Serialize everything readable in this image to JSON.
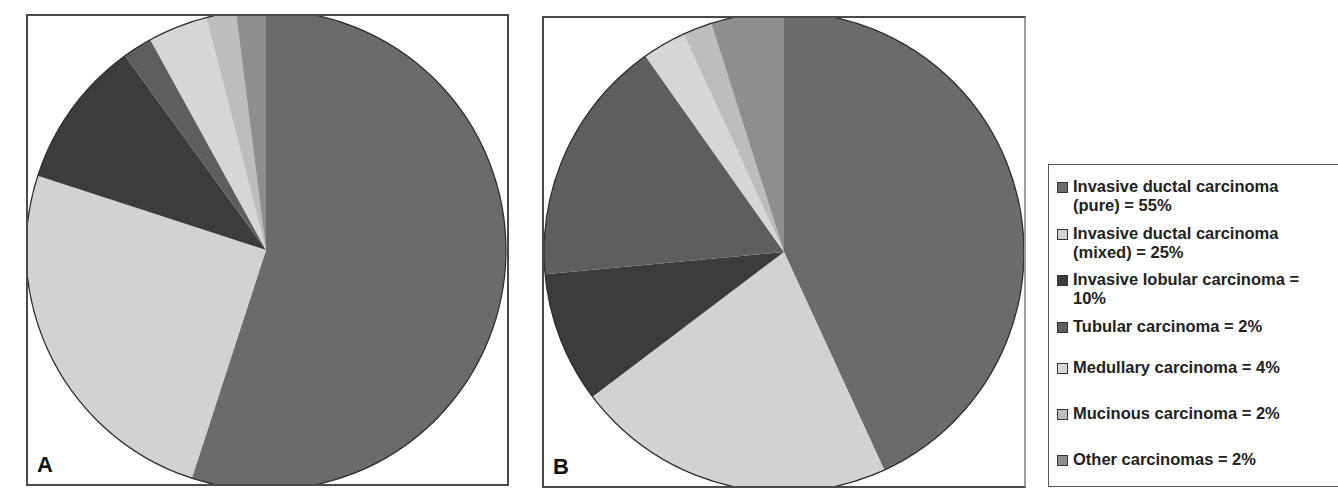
{
  "chart_data": [
    {
      "type": "pie",
      "panel": "A",
      "title": "",
      "start_angle": "12 o'clock, clockwise",
      "categories": [
        "Invasive ductal carcinoma (pure)",
        "Invasive ductal carcinoma (mixed)",
        "Invasive lobular carcinoma",
        "Tubular carcinoma",
        "Medullary carcinoma",
        "Mucinous carcinoma",
        "Other carcinomas"
      ],
      "values": [
        55,
        25,
        10,
        2,
        4,
        2,
        2
      ],
      "unit": "%"
    },
    {
      "type": "pie",
      "panel": "B",
      "title": "",
      "start_angle": "12 o'clock, clockwise",
      "categories": [
        "Invasive ductal carcinoma (pure)",
        "Invasive ductal carcinoma (mixed)",
        "Invasive lobular carcinoma",
        "Tubular carcinoma",
        "Medullary carcinoma",
        "Mucinous carcinoma",
        "Other carcinomas"
      ],
      "values": [
        44,
        22,
        9,
        17,
        3,
        2,
        5
      ],
      "unit": "%",
      "note": "values estimated from slice angles; not labeled"
    }
  ],
  "panels": {
    "a": {
      "label": "A"
    },
    "b": {
      "label": "B"
    }
  },
  "legend": {
    "items": [
      {
        "text": "Invasive ductal carcinoma\n(pure) = 55%",
        "color": "#6b6b6b"
      },
      {
        "text": "Invasive ductal carcinoma\n(mixed) = 25%",
        "color": "#d2d2d2"
      },
      {
        "text": "Invasive lobular carcinoma =\n10%",
        "color": "#3c3c3c"
      },
      {
        "text": "Tubular carcinoma  = 2%",
        "color": "#5e5e5e"
      },
      {
        "text": "Medullary carcinoma = 4%",
        "color": "#d6d6d6"
      },
      {
        "text": "Mucinous carcinoma  = 2%",
        "color": "#bdbdbd"
      },
      {
        "text": "Other carcinomas = 2%",
        "color": "#8e8e8e"
      }
    ]
  }
}
